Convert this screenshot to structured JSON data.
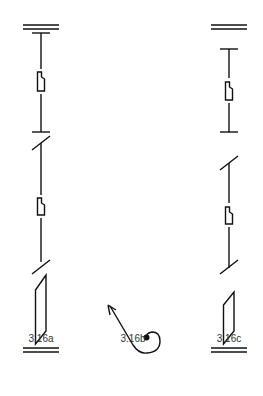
{
  "figures": [
    {
      "id": "a",
      "label": "3.16a"
    },
    {
      "id": "b",
      "label": "3.16b"
    },
    {
      "id": "c",
      "label": "3.16c"
    }
  ],
  "colors": {
    "stroke": "#111111",
    "text": "#333333",
    "background": "#ffffff"
  }
}
